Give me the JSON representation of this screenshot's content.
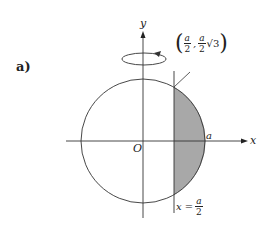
{
  "figure": {
    "part_label": "a)",
    "axes": {
      "x_label": "x",
      "y_label": "y",
      "origin_label": "O"
    },
    "circle_radius_label": "a",
    "point_label": {
      "open": "(",
      "x_num": "a",
      "x_den": "2",
      "sep": ",",
      "y_num": "a",
      "y_den": "2",
      "y_extra": "√3",
      "close": ")"
    },
    "line_label": {
      "prefix": "x =",
      "num": "a",
      "den": "2"
    },
    "rotation": "rotation about y-axis",
    "colors": {
      "stroke": "#333333",
      "shade": "#a8a8a8"
    }
  }
}
